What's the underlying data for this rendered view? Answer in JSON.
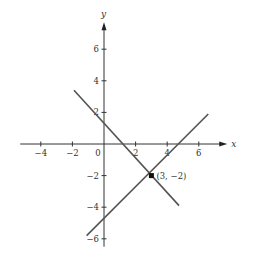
{
  "chart_data": {
    "type": "line",
    "title": "",
    "xlabel": "x",
    "ylabel": "y",
    "xlim": [
      -5.3,
      7.8
    ],
    "ylim": [
      -6.5,
      7.7
    ],
    "grid": false,
    "x_ticks": [
      -4,
      -2,
      0,
      2,
      4,
      6
    ],
    "x_tick_labels": [
      "−4",
      "−2",
      "0",
      "2",
      "4",
      "6"
    ],
    "y_ticks": [
      -6,
      -4,
      -2,
      2,
      4,
      6
    ],
    "y_tick_labels": [
      "−6",
      "−4",
      "−2",
      "2",
      "4",
      "6"
    ],
    "series": [
      {
        "name": "decreasing-line",
        "x": [
          -1.9,
          4.75
        ],
        "y": [
          3.4,
          -3.9
        ]
      },
      {
        "name": "increasing-line",
        "x": [
          -1.1,
          6.6
        ],
        "y": [
          -5.8,
          1.9
        ]
      }
    ],
    "points": [
      {
        "x": 3,
        "y": -2,
        "label": "(3, −2)"
      }
    ]
  }
}
